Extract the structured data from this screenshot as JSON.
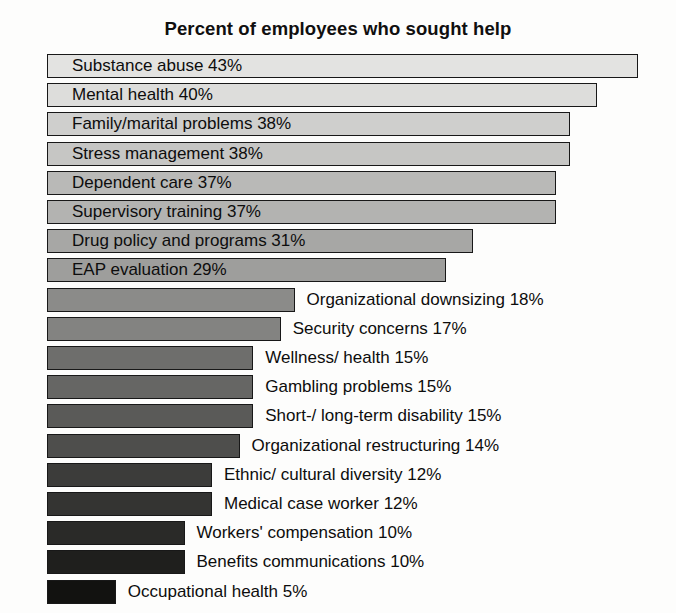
{
  "chart_data": {
    "type": "bar",
    "orientation": "horizontal",
    "title": "Percent of employees who sought help",
    "xlabel": "",
    "ylabel": "",
    "xlim": [
      0,
      45
    ],
    "grid": false,
    "legend": null,
    "value_suffix": "%",
    "categories": [
      "Substance abuse",
      "Mental health",
      "Family/marital problems",
      "Stress management",
      "Dependent care",
      "Supervisory training",
      "Drug policy and programs",
      "EAP evaluation",
      "Organizational downsizing",
      "Security concerns",
      "Wellness/ health",
      "Gambling problems",
      "Short-/ long-term disability",
      "Organizational restructuring",
      "Ethnic/ cultural diversity",
      "Medical case worker",
      "Workers' compensation",
      "Benefits communications",
      "Occupational health"
    ],
    "values": [
      43,
      40,
      38,
      38,
      37,
      37,
      31,
      29,
      18,
      17,
      15,
      15,
      15,
      14,
      12,
      12,
      10,
      10,
      5
    ],
    "bars": [
      {
        "label": "Substance abuse 43%",
        "category": "Substance abuse",
        "value": 43,
        "fill": "#e3e3e1",
        "label_position": "inside"
      },
      {
        "label": "Mental health 40%",
        "category": "Mental health",
        "value": 40,
        "fill": "#dddddb",
        "label_position": "inside"
      },
      {
        "label": "Family/marital problems 38%",
        "category": "Family/marital problems",
        "value": 38,
        "fill": "#cfcfcd",
        "label_position": "inside"
      },
      {
        "label": "Stress management 38%",
        "category": "Stress management",
        "value": 38,
        "fill": "#c6c6c4",
        "label_position": "inside"
      },
      {
        "label": "Dependent care 37%",
        "category": "Dependent care",
        "value": 37,
        "fill": "#b9b9b7",
        "label_position": "inside"
      },
      {
        "label": "Supervisory training 37%",
        "category": "Supervisory training",
        "value": 37,
        "fill": "#b3b3b1",
        "label_position": "inside"
      },
      {
        "label": "Drug policy and programs 31%",
        "category": "Drug policy and programs",
        "value": 31,
        "fill": "#a7a7a5",
        "label_position": "inside"
      },
      {
        "label": "EAP evaluation 29%",
        "category": "EAP evaluation",
        "value": 29,
        "fill": "#9e9e9c",
        "label_position": "inside"
      },
      {
        "label": "Organizational downsizing 18%",
        "category": "Organizational downsizing",
        "value": 18,
        "fill": "#8b8b89",
        "label_position": "outside"
      },
      {
        "label": "Security concerns 17%",
        "category": "Security concerns",
        "value": 17,
        "fill": "#838381",
        "label_position": "outside"
      },
      {
        "label": "Wellness/ health 15%",
        "category": "Wellness/ health",
        "value": 15,
        "fill": "#6e6e6c",
        "label_position": "outside"
      },
      {
        "label": "Gambling problems 15%",
        "category": "Gambling problems",
        "value": 15,
        "fill": "#666664",
        "label_position": "outside"
      },
      {
        "label": "Short-/ long-term disability 15%",
        "category": "Short-/ long-term disability",
        "value": 15,
        "fill": "#5a5a58",
        "label_position": "outside"
      },
      {
        "label": "Organizational restructuring 14%",
        "category": "Organizational restructuring",
        "value": 14,
        "fill": "#4e4e4c",
        "label_position": "outside"
      },
      {
        "label": "Ethnic/ cultural diversity 12%",
        "category": "Ethnic/ cultural diversity",
        "value": 12,
        "fill": "#3c3c3a",
        "label_position": "outside"
      },
      {
        "label": "Medical case worker 12%",
        "category": "Medical case worker",
        "value": 12,
        "fill": "#343432",
        "label_position": "outside"
      },
      {
        "label": "Workers' compensation 10%",
        "category": "Workers' compensation",
        "value": 10,
        "fill": "#2a2a28",
        "label_position": "outside"
      },
      {
        "label": "Benefits communications 10%",
        "category": "Benefits communications",
        "value": 10,
        "fill": "#1f1f1d",
        "label_position": "outside"
      },
      {
        "label": "Occupational health 5%",
        "category": "Occupational health",
        "value": 5,
        "fill": "#121210",
        "label_position": "outside"
      }
    ]
  },
  "layout": {
    "bar_origin_x": 47,
    "px_per_unit": 13.75,
    "row_height": 29.2,
    "label_gap": 12
  }
}
